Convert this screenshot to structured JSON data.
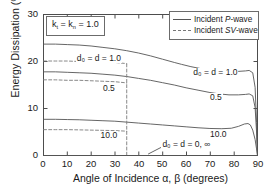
{
  "chart_data": {
    "type": "line",
    "title": "",
    "xlabel": "Angle of Incidence α, β  (degrees)",
    "ylabel": "Energy Dissipation (%)",
    "xlim": [
      0,
      90
    ],
    "ylim": [
      0,
      30
    ],
    "xticks": [
      0,
      10,
      20,
      30,
      40,
      50,
      60,
      70,
      80,
      90
    ],
    "yticks": [
      0,
      10,
      20,
      30
    ],
    "grid": false,
    "legend_position": "top-right",
    "legend": [
      {
        "label_prefix": "Incident ",
        "label_italic": "P",
        "label_suffix": "-wave",
        "style": "solid"
      },
      {
        "label_prefix": "Incident ",
        "label_italic": "SV",
        "label_suffix": "-wave",
        "style": "dashed"
      }
    ],
    "annotation_box": {
      "text_parts": [
        "k",
        "t",
        " = k",
        "n",
        " = 1.0"
      ],
      "text": "k_t = k_n = 1.0"
    },
    "annotations": [
      {
        "name": "d0-d-1.0-left",
        "text": "d₀ = d = 1.0",
        "x": 14.0,
        "y": 20.6
      },
      {
        "name": "d0-0.5-left",
        "text": "0.5",
        "x": 25.0,
        "y": 14.2
      },
      {
        "name": "d0-10.0-left",
        "text": "10.0",
        "x": 24.0,
        "y": 4.1
      },
      {
        "name": "d0-d-1.0-right",
        "text": "d₀ = d = 1.0",
        "x": 63.0,
        "y": 17.6
      },
      {
        "name": "d0-0.5-right",
        "text": "0.5",
        "x": 70.0,
        "y": 12.2
      },
      {
        "name": "d0-10.0-right",
        "text": "10.0",
        "x": 70.0,
        "y": 4.4
      },
      {
        "name": "d0-d-0-inf",
        "text": "d₀ = d = 0, ∞",
        "x": 50.0,
        "y": 2.3
      }
    ],
    "series": [
      {
        "name": "P-wave d0=d=1.0",
        "style": "solid",
        "x": [
          0,
          5,
          10,
          15,
          20,
          25,
          30,
          35,
          40,
          45,
          50,
          55,
          58,
          62,
          66,
          70,
          74,
          78,
          82,
          85,
          86.5,
          88,
          89,
          89.6,
          90
        ],
        "y": [
          23.7,
          23.7,
          23.6,
          23.5,
          23.3,
          23.0,
          22.7,
          22.3,
          21.8,
          21.2,
          20.5,
          19.8,
          19.4,
          18.9,
          18.5,
          18.2,
          18.0,
          17.9,
          17.9,
          18.0,
          18.1,
          17.6,
          14.5,
          7.0,
          0.0
        ]
      },
      {
        "name": "P-wave d0=d=0.5",
        "style": "solid",
        "x": [
          0,
          5,
          10,
          15,
          20,
          25,
          30,
          35,
          40,
          45,
          50,
          55,
          60,
          65,
          70,
          74,
          78,
          82,
          85,
          86.5,
          88,
          89,
          89.6,
          90
        ],
        "y": [
          17.8,
          17.8,
          17.7,
          17.6,
          17.5,
          17.3,
          17.1,
          16.8,
          16.4,
          16.0,
          15.5,
          15.0,
          14.4,
          13.9,
          13.4,
          13.1,
          12.9,
          12.9,
          13.0,
          13.1,
          12.7,
          10.2,
          5.0,
          0.0
        ]
      },
      {
        "name": "P-wave d0=d=10.0",
        "style": "solid",
        "x": [
          0,
          5,
          10,
          15,
          20,
          25,
          30,
          35,
          40,
          45,
          50,
          55,
          60,
          65,
          70,
          75,
          79,
          82,
          84.5,
          86,
          87,
          88,
          89,
          89.6,
          90
        ],
        "y": [
          7.7,
          7.7,
          7.65,
          7.6,
          7.5,
          7.4,
          7.3,
          7.1,
          6.9,
          6.7,
          6.5,
          6.3,
          6.1,
          5.9,
          5.75,
          5.7,
          5.8,
          6.2,
          6.7,
          6.8,
          6.5,
          5.4,
          3.4,
          1.4,
          0.0
        ]
      },
      {
        "name": "SV-wave d0=d=1.0",
        "style": "dashed",
        "x": [
          0,
          5,
          10,
          15,
          20,
          25,
          30,
          34,
          35
        ],
        "y": [
          20.1,
          20.1,
          20.1,
          20.0,
          20.0,
          19.9,
          19.8,
          19.6,
          19.5
        ]
      },
      {
        "name": "SV-wave d0=d=0.5",
        "style": "dashed",
        "x": [
          0,
          5,
          10,
          15,
          20,
          25,
          30,
          34,
          35
        ],
        "y": [
          16.1,
          16.1,
          16.0,
          16.0,
          15.9,
          15.8,
          15.7,
          15.5,
          15.4
        ]
      },
      {
        "name": "SV-wave d0=d=10.0",
        "style": "dashed",
        "x": [
          0,
          5,
          10,
          15,
          20,
          25,
          30,
          34,
          35
        ],
        "y": [
          5.5,
          5.5,
          5.5,
          5.45,
          5.4,
          5.35,
          5.3,
          5.2,
          5.15
        ]
      },
      {
        "name": "SV-wave critical-angle drop",
        "style": "dashed-vertical",
        "x": [
          35,
          35
        ],
        "y": [
          19.5,
          0.0
        ]
      },
      {
        "name": "baseline d0=d=0,inf",
        "style": "solid",
        "x": [
          0,
          90
        ],
        "y": [
          0.0,
          0.0
        ]
      }
    ],
    "leader_line": {
      "name": "annotation-leader",
      "x1": 44.0,
      "y1": 0.3,
      "x2": 50.5,
      "y2": 2.0
    }
  },
  "colors": {
    "solid_curve": "#555555",
    "dashed_curve": "#7a7a7a",
    "axis": "#4d4d4d",
    "text": "#1a1a1a",
    "background": "#ffffff"
  }
}
